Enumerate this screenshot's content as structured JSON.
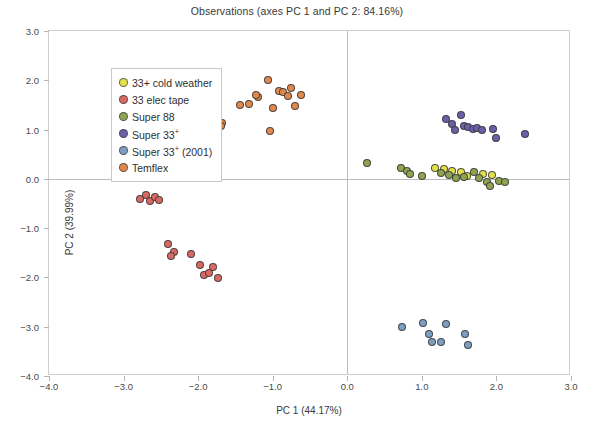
{
  "chart_data": {
    "type": "scatter",
    "title": "Observations (axes PC 1 and PC 2: 84.16%)",
    "xlabel": "PC 1 (44.17%)",
    "ylabel": "PC 2 (39.99%)",
    "xlim": [
      -4.0,
      3.0
    ],
    "ylim": [
      -4.0,
      3.0
    ],
    "xticks": [
      "-4.0",
      "-3.0",
      "-2.0",
      "-1.0",
      "0.0",
      "1.0",
      "2.0",
      "3.0"
    ],
    "xtick_values": [
      -4.0,
      -3.0,
      -2.0,
      -1.0,
      0.0,
      1.0,
      2.0,
      3.0
    ],
    "yticks": [
      "3.0",
      "2.0",
      "1.0",
      "0.0",
      "-1.0",
      "-2.0",
      "-3.0",
      "-4.0"
    ],
    "ytick_values": [
      3.0,
      2.0,
      1.0,
      0.0,
      -1.0,
      -2.0,
      -3.0,
      -4.0
    ],
    "grid": false,
    "zero_lines": true,
    "legend_position": "upper-left-inside",
    "series": [
      {
        "name": "33+ cold weather",
        "color": "#e3e04a",
        "points": [
          [
            1.18,
            0.22
          ],
          [
            1.3,
            0.19
          ],
          [
            1.52,
            0.13
          ],
          [
            1.82,
            0.1
          ],
          [
            1.94,
            0.08
          ],
          [
            1.6,
            0.05
          ],
          [
            1.41,
            0.16
          ]
        ]
      },
      {
        "name": "33 elec tape",
        "color": "#d96a63",
        "points": [
          [
            -2.78,
            -0.4
          ],
          [
            -2.7,
            -0.33
          ],
          [
            -2.64,
            -0.45
          ],
          [
            -2.58,
            -0.36
          ],
          [
            -2.52,
            -0.42
          ],
          [
            -2.4,
            -1.32
          ],
          [
            -2.33,
            -1.48
          ],
          [
            -2.36,
            -1.56
          ],
          [
            -2.1,
            -1.52
          ],
          [
            -1.98,
            -1.74
          ],
          [
            -1.92,
            -1.95
          ],
          [
            -1.86,
            -1.92
          ],
          [
            -1.8,
            -1.78
          ],
          [
            -1.74,
            -2.02
          ]
        ]
      },
      {
        "name": "Super 88",
        "color": "#8fa350",
        "points": [
          [
            0.27,
            0.32
          ],
          [
            0.72,
            0.23
          ],
          [
            0.8,
            0.16
          ],
          [
            0.84,
            0.09
          ],
          [
            1.0,
            0.05
          ],
          [
            1.26,
            0.12
          ],
          [
            1.36,
            0.08
          ],
          [
            1.46,
            0.02
          ],
          [
            1.56,
            0.04
          ],
          [
            1.7,
            0.13
          ],
          [
            1.76,
            0.02
          ],
          [
            1.88,
            -0.06
          ],
          [
            1.92,
            -0.14
          ],
          [
            2.04,
            -0.04
          ],
          [
            2.12,
            -0.06
          ]
        ]
      },
      {
        "name": "Super 33+",
        "color": "#6b5fa8",
        "points": [
          [
            1.32,
            1.22
          ],
          [
            1.4,
            1.12
          ],
          [
            1.44,
            1.0
          ],
          [
            1.52,
            1.3
          ],
          [
            1.56,
            1.08
          ],
          [
            1.62,
            1.06
          ],
          [
            1.68,
            1.02
          ],
          [
            1.74,
            1.04
          ],
          [
            1.8,
            1.0
          ],
          [
            1.96,
            1.02
          ],
          [
            2.0,
            0.82
          ],
          [
            2.38,
            0.92
          ]
        ]
      },
      {
        "name": "Super 33+ (2001)",
        "color": "#7d9ec0",
        "points": [
          [
            0.74,
            -3.0
          ],
          [
            1.02,
            -2.92
          ],
          [
            1.1,
            -3.14
          ],
          [
            1.14,
            -3.32
          ],
          [
            1.26,
            -3.3
          ],
          [
            1.32,
            -2.94
          ],
          [
            1.58,
            -3.14
          ],
          [
            1.62,
            -3.38
          ]
        ]
      },
      {
        "name": "Temflex",
        "color": "#e0894c",
        "points": [
          [
            -1.06,
            2.0
          ],
          [
            -0.92,
            1.78
          ],
          [
            -0.86,
            1.76
          ],
          [
            -1.2,
            1.66
          ],
          [
            -1.22,
            1.7
          ],
          [
            -0.8,
            1.68
          ],
          [
            -0.76,
            1.84
          ],
          [
            -0.62,
            1.7
          ],
          [
            -1.44,
            1.5
          ],
          [
            -1.32,
            1.52
          ],
          [
            -1.0,
            1.44
          ],
          [
            -0.7,
            1.48
          ],
          [
            -1.92,
            1.12
          ],
          [
            -1.8,
            1.1
          ],
          [
            -1.68,
            1.14
          ],
          [
            -1.7,
            1.08
          ],
          [
            -1.04,
            0.98
          ]
        ]
      }
    ]
  },
  "legend": {
    "items": [
      {
        "label": "33+ cold weather",
        "color": "#e3e04a"
      },
      {
        "label": "33 elec tape",
        "color": "#d96a63"
      },
      {
        "label": "Super 88",
        "color": "#8fa350"
      },
      {
        "label": "Super 33+",
        "color": "#6b5fa8"
      },
      {
        "label": "Super 33+ (2001)",
        "color": "#7d9ec0"
      },
      {
        "label": "Temflex",
        "color": "#e0894c"
      }
    ]
  },
  "colors": {
    "frame": "#cfcfcf",
    "zero_line": "#bdbdbd",
    "text": "#3a3a3a",
    "background": "#ffffff"
  }
}
